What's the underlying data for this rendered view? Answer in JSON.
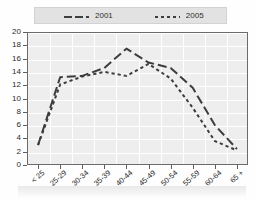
{
  "title": "",
  "legend": {
    "items": [
      {
        "label": "2001",
        "style": "long-dash",
        "color": "#3d3d3d"
      },
      {
        "label": "2005",
        "style": "short-dash",
        "color": "#3d3d3d"
      }
    ]
  },
  "axes": {
    "y_ticks": [
      "20",
      "18",
      "16",
      "14",
      "12",
      "10",
      "8",
      "6",
      "4",
      "2",
      "0"
    ],
    "x_ticks": [
      "< 25",
      "25-29",
      "30-34",
      "35-39",
      "40-44",
      "45-49",
      "50-54",
      "55-59",
      "60-64",
      "65 +"
    ]
  },
  "colors": {
    "plot_background": "#eeeeee",
    "grid": "#ffffff",
    "frame": "#6b6b6b",
    "legend_background": "#e2e2e2",
    "line": "#3d3d3d"
  },
  "chart_data": {
    "type": "line",
    "title": "",
    "xlabel": "",
    "ylabel": "",
    "ylim": [
      0,
      20
    ],
    "ytick_step": 2,
    "grid": true,
    "legend_position": "top",
    "categories": [
      "< 25",
      "25-29",
      "30-34",
      "35-39",
      "40-44",
      "45-49",
      "50-54",
      "55-59",
      "60-64",
      "65 +"
    ],
    "series": [
      {
        "name": "2001",
        "style": "long-dash",
        "values": [
          3.0,
          13.2,
          13.4,
          14.6,
          17.5,
          15.4,
          14.6,
          11.6,
          6.0,
          2.4
        ]
      },
      {
        "name": "2005",
        "style": "short-dash",
        "values": [
          3.0,
          12.1,
          13.3,
          14.0,
          13.4,
          15.2,
          13.0,
          8.6,
          3.6,
          2.2
        ]
      }
    ]
  }
}
